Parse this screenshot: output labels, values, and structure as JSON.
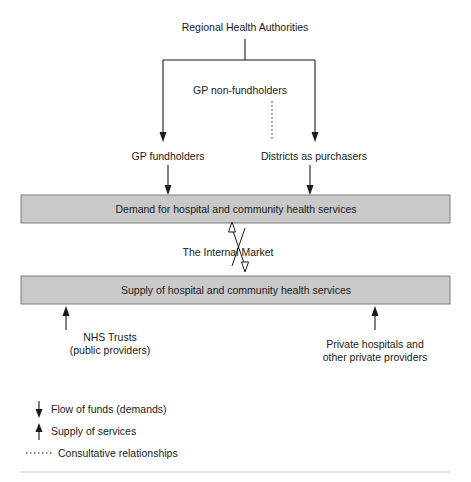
{
  "diagram": {
    "title_node": "Regional Health Authorities",
    "nodes": [
      {
        "id": "gp-non-fundholders",
        "label": "GP non-fundholders"
      },
      {
        "id": "gp-fundholders",
        "label": "GP fundholders"
      },
      {
        "id": "districts-as-purchasers",
        "label": "Districts as purchasers"
      }
    ],
    "bands": [
      {
        "id": "demand-band",
        "label": "Demand for hospital and community health services"
      },
      {
        "id": "supply-band",
        "label": "Supply of hospital and community health services"
      }
    ],
    "market_label": "The Internal   Market",
    "providers": [
      {
        "id": "nhs-trusts",
        "label": "NHS Trusts\n(public providers)"
      },
      {
        "id": "private-hospitals",
        "label": "Private hospitals and\nother private providers"
      }
    ],
    "legend": [
      {
        "id": "flow-of-funds",
        "label": "Flow of funds (demands)",
        "marker": "down-arrow-icon"
      },
      {
        "id": "supply-of-services",
        "label": "Supply of services",
        "marker": "up-arrow-icon"
      },
      {
        "id": "consultative-relationships",
        "label": "Consultative relationships",
        "marker": "dotted-line-icon"
      }
    ],
    "colors": {
      "band_fill": "#c9c9c9",
      "band_stroke": "#7d7d7d",
      "line": "#1a1a1a"
    }
  }
}
